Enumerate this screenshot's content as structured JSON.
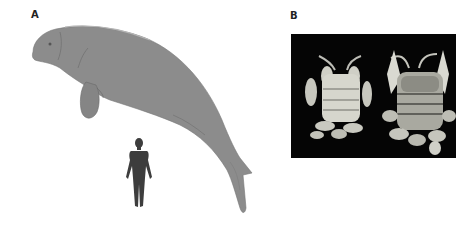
{
  "figure": {
    "panels": [
      {
        "label": "A",
        "content": "Illustration of a large sea cow (sirenian) with a human silhouette for scale",
        "elements": [
          "sea-cow-illustration",
          "human-silhouette-scale"
        ]
      },
      {
        "label": "B",
        "content": "Photograph of two crustacean specimens (dorsal view) on black background",
        "elements": [
          "specimen-left",
          "specimen-right"
        ]
      }
    ]
  },
  "colors": {
    "animal_fill": "#8a8a8a",
    "animal_shadow": "#6e6e6e",
    "human_fill": "#3d3d3d",
    "photo_background": "#050505",
    "specimen_light": "#d8d8d0",
    "specimen_dark": "#5a5a55"
  }
}
